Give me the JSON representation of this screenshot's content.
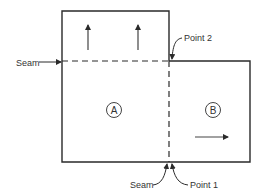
{
  "labels": {
    "seam_left": "Seam",
    "seam_bottom": "Seam",
    "point_1": "Point 1",
    "point_2": "Point 2",
    "panel_a": "A",
    "panel_b": "B"
  },
  "colors": {
    "line": "#2a2a2a",
    "text": "#333333",
    "background": "#ffffff"
  }
}
